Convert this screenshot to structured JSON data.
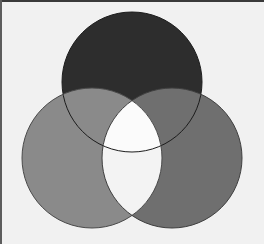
{
  "figure": {
    "width": 264,
    "height": 244,
    "background_color": "#f1f1f1",
    "frame": {
      "top_rule_color": "#3a3a3a",
      "left_rule_color": "#5d5d5d",
      "rule_thickness": 2
    }
  },
  "chart_data": {
    "type": "diagram",
    "diagram_kind": "venn3",
    "xlabel": "",
    "ylabel": "",
    "grid": false,
    "legend": "none",
    "canvas": {
      "width": 264,
      "height": 244
    },
    "sets": [
      {
        "name": "A",
        "position": "top",
        "label": "",
        "cx": 132,
        "cy": 82,
        "r": 70,
        "fill": "#2d2d2d",
        "stroke": "#1c1c1c",
        "stroke_width": 1,
        "z": 1
      },
      {
        "name": "B",
        "position": "bottom-left",
        "label": "",
        "cx": 92,
        "cy": 158,
        "r": 70,
        "fill": "#8a8a8a",
        "stroke": "#4a4a4a",
        "stroke_width": 1,
        "z": 2
      },
      {
        "name": "C",
        "position": "bottom-right",
        "label": "",
        "cx": 172,
        "cy": 158,
        "r": 70,
        "fill": "#6f6f6f",
        "stroke": "#3f3f3f",
        "stroke_width": 1,
        "z": 3
      }
    ],
    "regions": [
      {
        "id": "A-only",
        "sets": [
          "A"
        ],
        "fill": "#2d2d2d",
        "label": ""
      },
      {
        "id": "B-only",
        "sets": [
          "B"
        ],
        "fill": "#8a8a8a",
        "label": ""
      },
      {
        "id": "C-only",
        "sets": [
          "C"
        ],
        "fill": "#6f6f6f",
        "label": ""
      },
      {
        "id": "A-and-B",
        "sets": [
          "A",
          "B"
        ],
        "fill": "#8a8a8a",
        "label": ""
      },
      {
        "id": "A-and-C",
        "sets": [
          "A",
          "C"
        ],
        "fill": "#6f6f6f",
        "label": ""
      },
      {
        "id": "B-and-C",
        "sets": [
          "B",
          "C"
        ],
        "fill": "#f3f3f3",
        "label": ""
      },
      {
        "id": "A-B-C",
        "sets": [
          "A",
          "B",
          "C"
        ],
        "fill": "#fbfbfb",
        "label": ""
      }
    ],
    "outline_color": "#3c3c3c",
    "outline_width": 1
  }
}
